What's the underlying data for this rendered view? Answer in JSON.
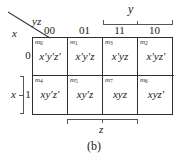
{
  "figure": {
    "caption": "(b)",
    "type": "karnaugh-map",
    "corner": {
      "column_vars": "yz",
      "row_var": "x"
    },
    "columns": {
      "headers": [
        "00",
        "01",
        "11",
        "10"
      ]
    },
    "rows": {
      "headers": [
        "0",
        "1"
      ]
    },
    "braces": {
      "y": {
        "label": "y",
        "spans": [
          "11",
          "10"
        ]
      },
      "z": {
        "label": "z",
        "spans": [
          "01",
          "11"
        ]
      },
      "x": {
        "label": "x",
        "spans": [
          "1"
        ]
      }
    },
    "cells": [
      {
        "minterm": "m",
        "index": "0",
        "expr": "x′y′z′",
        "row": "0",
        "col": "00"
      },
      {
        "minterm": "m",
        "index": "1",
        "expr": "x′y′z",
        "row": "0",
        "col": "01"
      },
      {
        "minterm": "m",
        "index": "3",
        "expr": "x′yz",
        "row": "0",
        "col": "11"
      },
      {
        "minterm": "m",
        "index": "2",
        "expr": "x′yz′",
        "row": "0",
        "col": "10"
      },
      {
        "minterm": "m",
        "index": "4",
        "expr": "xy′z′",
        "row": "1",
        "col": "00"
      },
      {
        "minterm": "m",
        "index": "5",
        "expr": "xy′z",
        "row": "1",
        "col": "01"
      },
      {
        "minterm": "m",
        "index": "7",
        "expr": "xyz",
        "row": "1",
        "col": "11"
      },
      {
        "minterm": "m",
        "index": "6",
        "expr": "xyz′",
        "row": "1",
        "col": "10"
      }
    ]
  },
  "colors": {
    "grid_line": "#2e2e2e",
    "brace_line": "#55565a",
    "text": "#1a1a1a",
    "background": "#ffffff"
  }
}
